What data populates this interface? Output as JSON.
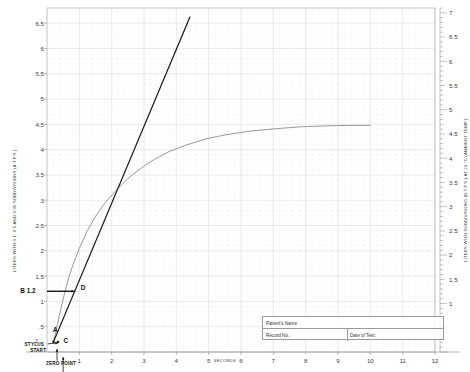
{
  "chart_data": {
    "type": "line",
    "title": "",
    "xlabel": "SECONDS",
    "ylabel_left": "LITERS WITH 0.1, 0.5 AND 0.05 SUBDIVISIONS (A.T.P.S.)",
    "ylabel_right": "LITERS WITH SUBDIVISIONS (B.T.P.S.) AT 23 °C (AMBIENT TEMP.)",
    "xlim": [
      0,
      12
    ],
    "ylim_left": [
      0,
      6.8
    ],
    "ylim_right": [
      0,
      7.1
    ],
    "grid": true,
    "legend": "none",
    "x_ticks": [
      "1",
      "2",
      "3",
      "4",
      "5",
      "6",
      "7",
      "8",
      "9",
      "10",
      "11",
      "12"
    ],
    "x_tick_values": [
      1,
      2,
      3,
      4,
      5,
      6,
      7,
      8,
      9,
      10,
      11,
      12
    ],
    "y_ticks_left": [
      "6.5",
      "6",
      "5.5",
      "5",
      "4.5",
      "4",
      "3.5",
      "3",
      "2.5",
      "2",
      "1.5",
      "1",
      ".5"
    ],
    "y_tick_values_left": [
      6.5,
      6,
      5.5,
      5,
      4.5,
      4,
      3.5,
      3,
      2.5,
      2,
      1.5,
      1,
      0.5
    ],
    "y_ticks_right": [
      "7",
      "6.5",
      "6",
      "5.5",
      "5",
      "4.5",
      "4",
      "3.5",
      "3",
      "2.5",
      "2",
      "1.5",
      "1"
    ],
    "y_tick_values_right": [
      7,
      6.5,
      6,
      5.5,
      5,
      4.5,
      4,
      3.5,
      3,
      2.5,
      2,
      1.5,
      1
    ],
    "series": [
      {
        "name": "spirogram-curve",
        "color": "#8c8c8c",
        "width": 0.9,
        "x": [
          0.2,
          0.28,
          0.38,
          0.5,
          0.65,
          0.8,
          1.0,
          1.25,
          1.5,
          1.8,
          2.1,
          2.5,
          2.9,
          3.3,
          3.8,
          4.3,
          4.9,
          5.5,
          6.2,
          7.0,
          7.8,
          8.6,
          9.4,
          10.0
        ],
        "y": [
          0.2,
          0.42,
          0.72,
          1.05,
          1.42,
          1.72,
          2.05,
          2.4,
          2.68,
          2.95,
          3.17,
          3.43,
          3.63,
          3.8,
          3.97,
          4.09,
          4.21,
          4.29,
          4.36,
          4.41,
          4.45,
          4.47,
          4.48,
          4.48
        ]
      },
      {
        "name": "tangent-line",
        "color": "#1a1a1a",
        "width": 1.25,
        "x": [
          0.2,
          4.42
        ],
        "y": [
          0.2,
          6.62
        ]
      },
      {
        "name": "fev-reference-line",
        "color": "#111111",
        "width": 1.1,
        "x": [
          0.0,
          0.86
        ],
        "y": [
          1.2,
          1.2
        ]
      }
    ],
    "annotations": [
      {
        "label": "A",
        "x": 0.22,
        "y": 0.34,
        "note": "start of forced expiration point"
      },
      {
        "label": "B 1.2",
        "x": -0.02,
        "y": 1.2,
        "note": "back-extrapolated volume level 1.2 L"
      },
      {
        "label": "C",
        "x": 0.42,
        "y": 0.22,
        "note": "stylus contact point"
      },
      {
        "label": "D",
        "x": 0.95,
        "y": 1.26,
        "note": "intersection of tangent with 1.2 L line"
      },
      {
        "label": "STYLUS",
        "x": 0.05,
        "y": 0.13,
        "note": "stylus pointer"
      },
      {
        "label": "START",
        "x": 0.16,
        "y": 0.02,
        "note": "recording start"
      },
      {
        "label": "ZERO POINT",
        "x": 0.4,
        "y": -0.22,
        "note": "zero reference"
      }
    ]
  },
  "axis_words": {
    "seconds": "SECONDS"
  },
  "form": {
    "patient_name_label": "Patient's Name",
    "record_no_label": "Record No.:",
    "date_of_test_label": "Date of Test:"
  }
}
